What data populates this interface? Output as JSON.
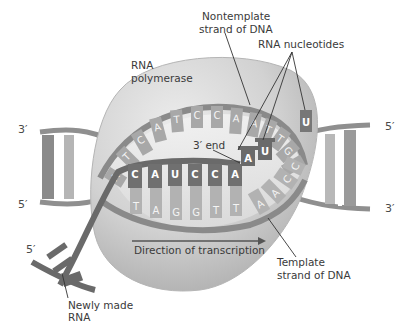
{
  "diagram": {
    "type": "transcription-elongation",
    "labels": {
      "nontemplate": [
        "Nontemplate",
        "strand of DNA"
      ],
      "rna_nucleotides": "RNA nucleotides",
      "polymerase": [
        "RNA",
        "polymerase"
      ],
      "three_prime_end": "3′ end",
      "direction": "Direction of transcription",
      "template": [
        "Template",
        "strand of DNA"
      ],
      "newly_made_rna": [
        "Newly made",
        "RNA"
      ]
    },
    "strand_ends": {
      "left_top": "3′",
      "left_bottom": "5′",
      "right_top": "5′",
      "right_bottom": "3′",
      "rna_5prime": "5′"
    },
    "nontemplate_bases": [
      "A",
      "T",
      "C",
      "A",
      "T",
      "C",
      "C",
      "A",
      "A",
      "T",
      "T",
      "G",
      "G"
    ],
    "rna_bases": [
      "C",
      "A",
      "U",
      "C",
      "C",
      "A"
    ],
    "incoming_rna_bases": [
      "A",
      "U",
      "U"
    ],
    "template_bases": [
      "T",
      "A",
      "G",
      "G",
      "T",
      "T",
      "A",
      "A",
      "C",
      "C"
    ],
    "colors": {
      "polymerase": "#cfcfcf",
      "dna_backbone": "#9a9a9a",
      "base_light": "#a8a8a8",
      "base_dark": "#6e6e6e",
      "rna": "#707070",
      "label_text": "#3a3a3a"
    }
  }
}
